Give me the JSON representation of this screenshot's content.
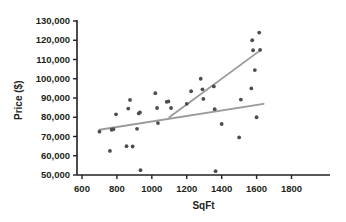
{
  "chart_data": {
    "type": "scatter",
    "title": "",
    "xlabel": "SqFt",
    "ylabel": "Price ($)",
    "xlim": [
      500,
      1800
    ],
    "ylim": [
      45000,
      132000
    ],
    "xticks": [
      600,
      800,
      1000,
      1200,
      1400,
      1600,
      1800
    ],
    "xtick_labels": [
      "600",
      "800",
      "1000",
      "1200",
      "1400",
      "1600",
      "1800"
    ],
    "yticks": [
      50000,
      60000,
      70000,
      80000,
      90000,
      100000,
      110000,
      120000,
      130000
    ],
    "ytick_labels": [
      "50,000",
      "60,000",
      "70,000",
      "80,000",
      "90,000",
      "100,000",
      "110,000",
      "120,000",
      "130,000"
    ],
    "grid": false,
    "legend": "none",
    "marker_color": "#4d4d4d",
    "line_color": "#9a9a9a",
    "axis_color": "#231f20",
    "points": [
      {
        "x": 700,
        "y": 72500
      },
      {
        "x": 760,
        "y": 62500
      },
      {
        "x": 770,
        "y": 73500
      },
      {
        "x": 780,
        "y": 73800
      },
      {
        "x": 795,
        "y": 81500
      },
      {
        "x": 855,
        "y": 65000
      },
      {
        "x": 865,
        "y": 84500
      },
      {
        "x": 875,
        "y": 89000
      },
      {
        "x": 890,
        "y": 64800
      },
      {
        "x": 915,
        "y": 74000
      },
      {
        "x": 925,
        "y": 82000
      },
      {
        "x": 932,
        "y": 82500
      },
      {
        "x": 935,
        "y": 52500
      },
      {
        "x": 1020,
        "y": 92500
      },
      {
        "x": 1030,
        "y": 84800
      },
      {
        "x": 1035,
        "y": 77000
      },
      {
        "x": 1085,
        "y": 88000
      },
      {
        "x": 1095,
        "y": 88200
      },
      {
        "x": 1110,
        "y": 84800
      },
      {
        "x": 1200,
        "y": 87000
      },
      {
        "x": 1225,
        "y": 93500
      },
      {
        "x": 1280,
        "y": 100000
      },
      {
        "x": 1290,
        "y": 94500
      },
      {
        "x": 1295,
        "y": 89500
      },
      {
        "x": 1355,
        "y": 96000
      },
      {
        "x": 1360,
        "y": 84200
      },
      {
        "x": 1365,
        "y": 52000
      },
      {
        "x": 1400,
        "y": 76500
      },
      {
        "x": 1500,
        "y": 69500
      },
      {
        "x": 1510,
        "y": 89200
      },
      {
        "x": 1570,
        "y": 95000
      },
      {
        "x": 1575,
        "y": 120000
      },
      {
        "x": 1580,
        "y": 114800
      },
      {
        "x": 1590,
        "y": 104500
      },
      {
        "x": 1600,
        "y": 80000
      },
      {
        "x": 1615,
        "y": 124000
      },
      {
        "x": 1620,
        "y": 115000
      }
    ],
    "trend_lines": [
      {
        "name": "flat-trend-line",
        "x1": 700,
        "y1": 73500,
        "x2": 1640,
        "y2": 87000
      },
      {
        "name": "steep-trend-line",
        "x1": 1100,
        "y1": 80000,
        "x2": 1625,
        "y2": 115000
      }
    ]
  }
}
